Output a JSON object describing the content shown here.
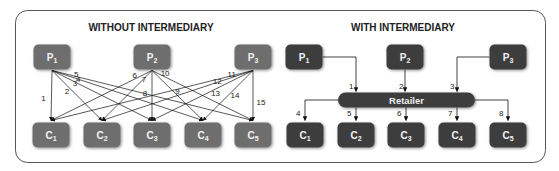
{
  "left_panel": {
    "title": "WITHOUT INTERMEDIARY",
    "producers": [
      {
        "letter": "P",
        "sub": "1"
      },
      {
        "letter": "P",
        "sub": "2"
      },
      {
        "letter": "P",
        "sub": "3"
      }
    ],
    "consumers": [
      {
        "letter": "C",
        "sub": "1"
      },
      {
        "letter": "C",
        "sub": "2"
      },
      {
        "letter": "C",
        "sub": "3"
      },
      {
        "letter": "C",
        "sub": "4"
      },
      {
        "letter": "C",
        "sub": "5"
      }
    ],
    "links": [
      {
        "label": "1",
        "from": 0,
        "to": 0
      },
      {
        "label": "2",
        "from": 0,
        "to": 1
      },
      {
        "label": "3",
        "from": 0,
        "to": 2
      },
      {
        "label": "4",
        "from": 0,
        "to": 3
      },
      {
        "label": "5",
        "from": 0,
        "to": 4
      },
      {
        "label": "6",
        "from": 1,
        "to": 0
      },
      {
        "label": "7",
        "from": 1,
        "to": 1
      },
      {
        "label": "8",
        "from": 1,
        "to": 2
      },
      {
        "label": "9",
        "from": 1,
        "to": 3
      },
      {
        "label": "10",
        "from": 1,
        "to": 4
      },
      {
        "label": "11",
        "from": 2,
        "to": 0
      },
      {
        "label": "12",
        "from": 2,
        "to": 1
      },
      {
        "label": "13",
        "from": 2,
        "to": 2
      },
      {
        "label": "14",
        "from": 2,
        "to": 3
      },
      {
        "label": "15",
        "from": 2,
        "to": 4
      }
    ]
  },
  "right_panel": {
    "title": "WITH INTERMEDIARY",
    "intermediary": "Retailer",
    "producers": [
      {
        "letter": "P",
        "sub": "1"
      },
      {
        "letter": "P",
        "sub": "2"
      },
      {
        "letter": "P",
        "sub": "3"
      }
    ],
    "consumers": [
      {
        "letter": "C",
        "sub": "1"
      },
      {
        "letter": "C",
        "sub": "2"
      },
      {
        "letter": "C",
        "sub": "3"
      },
      {
        "letter": "C",
        "sub": "4"
      },
      {
        "letter": "C",
        "sub": "5"
      }
    ],
    "inbound_labels": [
      "1",
      "2",
      "3"
    ],
    "outbound_labels": [
      "4",
      "5",
      "6",
      "7",
      "8"
    ]
  },
  "colors": {
    "left_box": "#6e6e6e",
    "right_box": "#3d3d3d",
    "frame": "#555555",
    "line": "#111111"
  }
}
